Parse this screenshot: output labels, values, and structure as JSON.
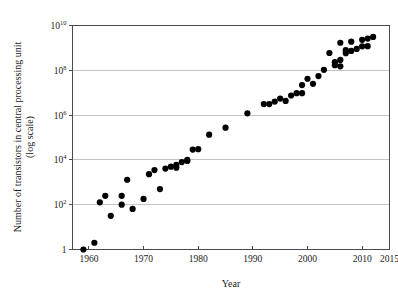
{
  "chart_data": {
    "type": "scatter",
    "title": "",
    "xlabel": "Year",
    "ylabel": "Number of transistors in central processing unit (log scale)",
    "ylabel_line1": "Number of transistors in central processing unit",
    "ylabel_line2": "(log scale)",
    "xlim": [
      1957,
      2015
    ],
    "ylim": [
      1,
      10000000000
    ],
    "yscale": "log",
    "grid": true,
    "legend": null,
    "xticks": [
      1960,
      1970,
      1980,
      1990,
      2000,
      2010,
      2015
    ],
    "xticklabels": [
      "1960",
      "1970",
      "1980",
      "1990",
      "2000",
      "2010",
      "2015"
    ],
    "yticks": [
      1,
      100,
      10000,
      1000000,
      100000000,
      10000000000
    ],
    "yticklabels": [
      "1",
      "10",
      "10",
      "10",
      "10",
      "10"
    ],
    "yticklabel_exponents": [
      "",
      "2",
      "4",
      "6",
      "8",
      "10"
    ],
    "point_color": "#000000",
    "point_size": 4.2,
    "points": [
      {
        "x": 1959,
        "y": 1
      },
      {
        "x": 1961,
        "y": 2
      },
      {
        "x": 1962,
        "y": 128
      },
      {
        "x": 1963,
        "y": 250
      },
      {
        "x": 1964,
        "y": 32
      },
      {
        "x": 1966,
        "y": 250
      },
      {
        "x": 1966,
        "y": 100
      },
      {
        "x": 1967,
        "y": 1300
      },
      {
        "x": 1968,
        "y": 65
      },
      {
        "x": 1970,
        "y": 180
      },
      {
        "x": 1971,
        "y": 2300
      },
      {
        "x": 1972,
        "y": 3500
      },
      {
        "x": 1973,
        "y": 500
      },
      {
        "x": 1974,
        "y": 4100
      },
      {
        "x": 1975,
        "y": 5000
      },
      {
        "x": 1976,
        "y": 4500
      },
      {
        "x": 1976,
        "y": 6000
      },
      {
        "x": 1977,
        "y": 8000
      },
      {
        "x": 1978,
        "y": 9000
      },
      {
        "x": 1978,
        "y": 10000
      },
      {
        "x": 1979,
        "y": 29000
      },
      {
        "x": 1980,
        "y": 30000
      },
      {
        "x": 1982,
        "y": 134000
      },
      {
        "x": 1985,
        "y": 275000
      },
      {
        "x": 1989,
        "y": 1200000
      },
      {
        "x": 1992,
        "y": 3100000
      },
      {
        "x": 1993,
        "y": 3100000
      },
      {
        "x": 1994,
        "y": 4000000
      },
      {
        "x": 1995,
        "y": 5500000
      },
      {
        "x": 1996,
        "y": 4300000
      },
      {
        "x": 1997,
        "y": 7500000
      },
      {
        "x": 1998,
        "y": 9500000
      },
      {
        "x": 1999,
        "y": 22000000
      },
      {
        "x": 1999,
        "y": 9500000
      },
      {
        "x": 2000,
        "y": 42000000
      },
      {
        "x": 2001,
        "y": 25000000
      },
      {
        "x": 2002,
        "y": 55000000
      },
      {
        "x": 2003,
        "y": 105000000
      },
      {
        "x": 2004,
        "y": 592000000
      },
      {
        "x": 2005,
        "y": 230000000
      },
      {
        "x": 2005,
        "y": 169000000
      },
      {
        "x": 2006,
        "y": 151000000
      },
      {
        "x": 2006,
        "y": 291000000
      },
      {
        "x": 2006,
        "y": 1700000000
      },
      {
        "x": 2007,
        "y": 582000000
      },
      {
        "x": 2007,
        "y": 789000000
      },
      {
        "x": 2008,
        "y": 731000000
      },
      {
        "x": 2008,
        "y": 1900000000
      },
      {
        "x": 2009,
        "y": 904000000
      },
      {
        "x": 2010,
        "y": 1170000000
      },
      {
        "x": 2010,
        "y": 2300000000
      },
      {
        "x": 2011,
        "y": 1200000000
      },
      {
        "x": 2011,
        "y": 2600000000
      },
      {
        "x": 2012,
        "y": 3100000000
      }
    ]
  }
}
